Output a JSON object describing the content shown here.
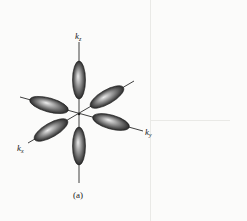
{
  "figure": {
    "caption": "(a)",
    "center": [
      79,
      114
    ],
    "axes": [
      {
        "id": "kz",
        "label_base": "k",
        "label_sub": "z",
        "from": [
          79,
          183
        ],
        "to": [
          79,
          42
        ],
        "label_pos": [
          75,
          32
        ]
      },
      {
        "id": "ky",
        "label_base": "k",
        "label_sub": "y",
        "from": [
          20,
          97
        ],
        "to": [
          143,
          131
        ],
        "label_pos": [
          145,
          128
        ]
      },
      {
        "id": "kx",
        "label_base": "k",
        "label_sub": "x",
        "from": [
          134,
          81
        ],
        "to": [
          28,
          143
        ],
        "label_pos": [
          17,
          144
        ]
      }
    ],
    "lobes": [
      {
        "name": "lobe-kz-positive",
        "cx": 79,
        "cy": 80,
        "rx": 6.5,
        "ry": 19,
        "angle": 0
      },
      {
        "name": "lobe-kz-negative",
        "cx": 79,
        "cy": 146,
        "rx": 6.5,
        "ry": 19,
        "angle": 0
      },
      {
        "name": "lobe-ky-negative",
        "cx": 49,
        "cy": 105,
        "rx": 20,
        "ry": 7,
        "angle": 15.5
      },
      {
        "name": "lobe-ky-positive",
        "cx": 111,
        "cy": 122,
        "rx": 19,
        "ry": 7,
        "angle": 15.5
      },
      {
        "name": "lobe-kx-positive",
        "cx": 51,
        "cy": 130,
        "rx": 19,
        "ry": 7,
        "angle": -30
      },
      {
        "name": "lobe-kx-negative",
        "cx": 107,
        "cy": 97,
        "rx": 19,
        "ry": 7,
        "angle": -30
      }
    ],
    "colors": {
      "background": "#fbfbfa",
      "axis": "#2a2a2a",
      "lobe_dark": "#2e2e2e",
      "lobe_mid": "#7a7a7a",
      "lobe_highlight": "#e8e8e8"
    }
  }
}
